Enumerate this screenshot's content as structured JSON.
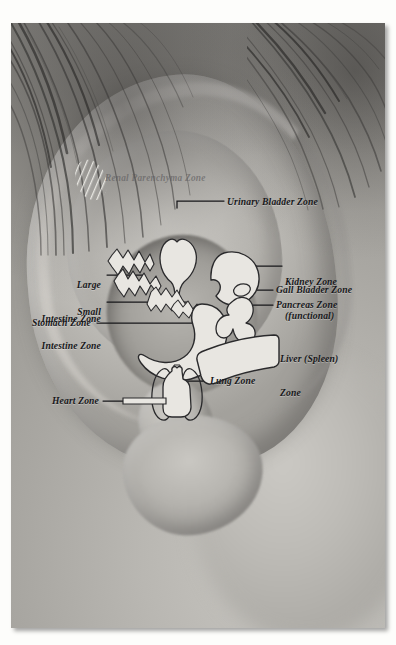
{
  "figure": {
    "kind": "auriculotherapy-ear-zone-photograph",
    "border_color": "#ffffff",
    "line_color": "#17171a",
    "organ_fill_color": "#e8e6e1",
    "organ_stroke_color": "#2a2a2c"
  },
  "faint_label": {
    "text": "Renal Parenchyma Zone",
    "color": "#5c5a5c"
  },
  "labels": [
    {
      "id": "urinary-bladder-zone",
      "text": "Urinary Bladder Zone",
      "side": "right-of-line",
      "align": "left"
    },
    {
      "id": "large-intestine-zone",
      "line1": "Large",
      "line2": "Intestine Zone",
      "align": "right"
    },
    {
      "id": "small-intestine-zone",
      "line1": "Small",
      "line2": "Intestine Zone",
      "align": "right"
    },
    {
      "id": "stomach-zone",
      "text": "Stomach Zone",
      "align": "right"
    },
    {
      "id": "kidney-zone",
      "line1": "Kidney Zone",
      "line2": "(functional)",
      "align": "left"
    },
    {
      "id": "gall-bladder-zone",
      "text": "Gall Bladder Zone",
      "align": "left"
    },
    {
      "id": "pancreas-zone",
      "text": "Pancreas Zone",
      "align": "left"
    },
    {
      "id": "liver-spleen-zone",
      "line1": "Liver (Spleen)",
      "line2": "Zone",
      "align": "left"
    },
    {
      "id": "lung-zone",
      "text": "Lung Zone",
      "align": "left"
    },
    {
      "id": "heart-zone",
      "text": "Heart Zone",
      "align": "right"
    }
  ],
  "zones": [
    {
      "id": "renal-parenchyma",
      "name": "Renal Parenchyma Zone",
      "style": "diagonal-hatched-oval"
    },
    {
      "id": "urinary-bladder",
      "name": "Urinary Bladder Zone",
      "style": "filled-outline"
    },
    {
      "id": "large-intestine",
      "name": "Large Intestine Zone",
      "style": "filled-outline"
    },
    {
      "id": "small-intestine",
      "name": "Small Intestine Zone",
      "style": "filled-outline"
    },
    {
      "id": "stomach",
      "name": "Stomach Zone",
      "style": "filled-outline"
    },
    {
      "id": "kidney",
      "name": "Kidney Zone (functional)",
      "style": "filled-outline"
    },
    {
      "id": "gall-bladder",
      "name": "Gall Bladder Zone",
      "style": "filled-outline"
    },
    {
      "id": "pancreas",
      "name": "Pancreas Zone",
      "style": "filled-outline"
    },
    {
      "id": "liver-spleen",
      "name": "Liver (Spleen) Zone",
      "style": "filled-outline"
    },
    {
      "id": "lung",
      "name": "Lung Zone",
      "style": "open-outline"
    },
    {
      "id": "heart",
      "name": "Heart Zone",
      "style": "filled-outline"
    }
  ]
}
